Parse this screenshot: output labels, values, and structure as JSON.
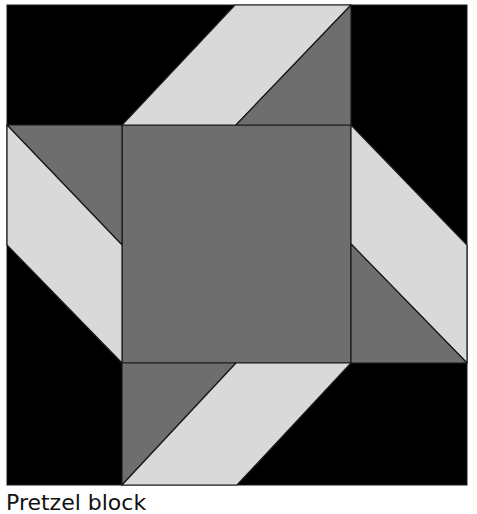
{
  "caption": "Pretzel block",
  "colors": {
    "background": "#ffffff",
    "black": "#000000",
    "medium": "#6e6e6e",
    "light": "#d9d9d9",
    "outline": "#1a1a1a"
  },
  "block": {
    "x": 7,
    "y": 5,
    "width": 460,
    "height": 480,
    "center_square": {
      "x": 122,
      "y": 125,
      "width": 229,
      "height": 238
    }
  },
  "pieces": [
    {
      "name": "center-square",
      "fill": "medium",
      "points": "122,125 351,125 351,363 122,363"
    },
    {
      "name": "top-light-band",
      "fill": "light",
      "points": "122,125 236,125 351,5 235,5"
    },
    {
      "name": "top-dark-triangle",
      "fill": "medium",
      "points": "236,125 351,125 351,5"
    },
    {
      "name": "right-light-band",
      "fill": "light",
      "points": "351,125 467,245 467,363 351,244"
    },
    {
      "name": "right-dark-triangle",
      "fill": "medium",
      "points": "351,244 467,363 351,363"
    },
    {
      "name": "bottom-dark-triangle",
      "fill": "medium",
      "points": "122,363 236,363 122,485"
    },
    {
      "name": "bottom-light-band",
      "fill": "light",
      "points": "236,363 351,363 237,485 122,485"
    },
    {
      "name": "left-dark-triangle",
      "fill": "medium",
      "points": "7,125 122,125 122,245"
    },
    {
      "name": "left-light-band",
      "fill": "light",
      "points": "7,125 122,245 122,363 7,245"
    }
  ]
}
